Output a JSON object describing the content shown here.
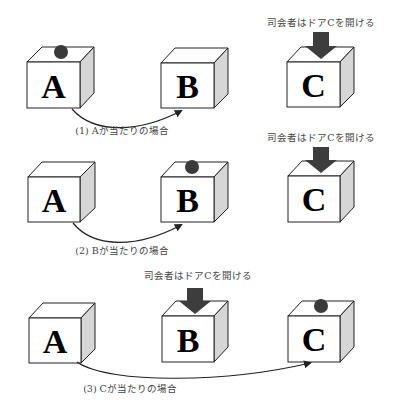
{
  "diagram": {
    "colors": {
      "box_side": "#d6d6d6",
      "ball": "#3a3a3a",
      "host_arrow": "#3d3d3d",
      "caption_text": "#444444"
    },
    "rows": [
      {
        "caption": "(1) Aが当たりの場合",
        "host_label": "司会者はドアCを開ける",
        "doors": [
          {
            "letter": "A",
            "has_prize": true,
            "opened_by_host": false
          },
          {
            "letter": "B",
            "has_prize": false,
            "opened_by_host": false
          },
          {
            "letter": "C",
            "has_prize": false,
            "opened_by_host": true
          }
        ],
        "switch_from": "A",
        "switch_to": "B"
      },
      {
        "caption": "(2) Bが当たりの場合",
        "host_label": "司会者はドアCを開ける",
        "doors": [
          {
            "letter": "A",
            "has_prize": false,
            "opened_by_host": false
          },
          {
            "letter": "B",
            "has_prize": true,
            "opened_by_host": false
          },
          {
            "letter": "C",
            "has_prize": false,
            "opened_by_host": true
          }
        ],
        "switch_from": "A",
        "switch_to": "B"
      },
      {
        "caption": "(3) Cが当たりの場合",
        "host_label": "司会者はドアCを開ける",
        "doors": [
          {
            "letter": "A",
            "has_prize": false,
            "opened_by_host": false
          },
          {
            "letter": "B",
            "has_prize": false,
            "opened_by_host": true
          },
          {
            "letter": "C",
            "has_prize": true,
            "opened_by_host": false
          }
        ],
        "switch_from": "A",
        "switch_to": "C"
      }
    ]
  }
}
